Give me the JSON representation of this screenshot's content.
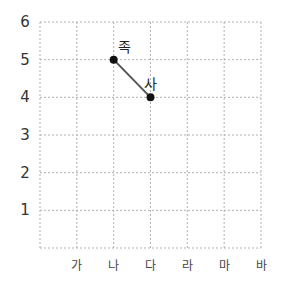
{
  "chart_data": {
    "type": "line",
    "title": "",
    "xlabel": "",
    "ylabel": "",
    "categories": [
      "가",
      "나",
      "다",
      "라",
      "마",
      "바"
    ],
    "y_ticks": [
      "1",
      "2",
      "3",
      "4",
      "5",
      "6"
    ],
    "ylim": [
      0,
      6
    ],
    "grid": true,
    "grid_style": "dotted",
    "points": [
      {
        "label": "족",
        "x": "나",
        "y": 5
      },
      {
        "label": "사",
        "x": "다",
        "y": 4
      }
    ],
    "segments": [
      {
        "from": "족",
        "to": "사"
      }
    ]
  },
  "colors": {
    "grid": "#b0b0b0",
    "line": "#555555",
    "point": "#111111",
    "text": "#333333"
  }
}
